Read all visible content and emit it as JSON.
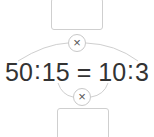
{
  "diagram": {
    "equation": {
      "a": "50",
      "b": "15",
      "c": "10",
      "d": "3",
      "ratio_sep": ":",
      "equals": "="
    },
    "outer_product": {
      "symbol": "×",
      "answer_box": ""
    },
    "inner_product": {
      "symbol": "×",
      "answer_box": ""
    },
    "colors": {
      "text": "#333333",
      "lines": "#cccccc"
    }
  }
}
